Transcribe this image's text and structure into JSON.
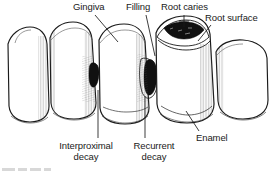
{
  "figure": {
    "type": "line-art medical illustration",
    "background_color": "#ffffff",
    "ink_color": "#1a1a1a",
    "lesion_color": "#111111"
  },
  "labels": {
    "gingiva": "Gingiva",
    "filling": "Filling",
    "root_caries": "Root caries",
    "root_surface": "Root surface",
    "enamel": "Enamel",
    "interproximal_decay_line1": "Interproximal",
    "interproximal_decay_line2": "decay",
    "recurrent_decay_line1": "Recurrent",
    "recurrent_decay_line2": "decay"
  },
  "annotations": [
    {
      "name": "gingiva",
      "text": "Gingiva",
      "leader": "diagonal down-right to gum line"
    },
    {
      "name": "filling",
      "text": "Filling",
      "leader": "diagonal down-right to restoration"
    },
    {
      "name": "root-caries",
      "text": "Root caries",
      "leader": "vertical down to dark cervical lesion"
    },
    {
      "name": "root-surface",
      "text": "Root surface",
      "leader": "diagonal down-left to exposed root"
    },
    {
      "name": "enamel",
      "text": "Enamel",
      "leader": "diagonal up-left to crown surface"
    },
    {
      "name": "interproximal-decay",
      "text": "Interproximal decay",
      "leader": "vertical up to lesion between teeth 1 and 2"
    },
    {
      "name": "recurrent-decay",
      "text": "Recurrent decay",
      "leader": "vertical up to lesion beside filling"
    }
  ],
  "teeth": [
    {
      "name": "tooth-1",
      "position": "far-left",
      "features": []
    },
    {
      "name": "tooth-2",
      "position": "left",
      "features": [
        "interproximal decay"
      ]
    },
    {
      "name": "tooth-3",
      "position": "center",
      "features": [
        "filling",
        "recurrent decay"
      ]
    },
    {
      "name": "tooth-4",
      "position": "right",
      "features": [
        "root caries",
        "root surface",
        "enamel"
      ]
    },
    {
      "name": "tooth-5",
      "position": "far-right",
      "features": []
    }
  ]
}
